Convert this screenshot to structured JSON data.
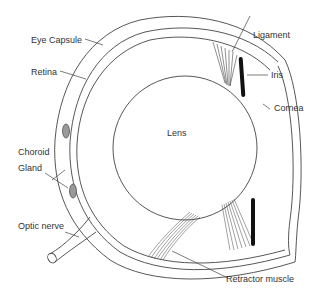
{
  "diagram": {
    "labels": {
      "eye_capsule": "Eye Capsule",
      "retina": "Retina",
      "choroid_gland_line1": "Choroid",
      "choroid_gland_line2": "Gland",
      "optic_nerve": "Optic nerve",
      "lens": "Lens",
      "ligament": "Ligament",
      "iris": "Iris",
      "cornea": "Cornea",
      "retractor_muscle": "Retractor muscle"
    },
    "colors": {
      "stroke": "#444444",
      "iris_fill": "#111111",
      "gland_fill": "#888888",
      "text": "#333333"
    }
  }
}
